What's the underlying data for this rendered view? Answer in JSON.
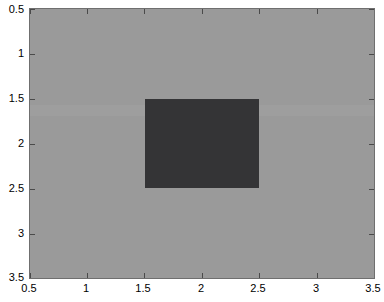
{
  "figure": {
    "background_color": "#ffffff",
    "axes_background_color": "#9a9a9a",
    "axes_border_color": "#6f6f6f",
    "tick_color": "#4a4a4a",
    "label_color": "#000000"
  },
  "chart_data": {
    "type": "heatmap",
    "title": "",
    "subtitle": "",
    "xlabel": "",
    "ylabel": "",
    "grid": false,
    "legend": "none",
    "colorbar": false,
    "xlim": [
      0.5,
      3.5
    ],
    "ylim": [
      0.5,
      3.5
    ],
    "y_axis_direction": "reversed",
    "xticks": [
      0.5,
      1,
      1.5,
      2,
      2.5,
      3,
      3.5
    ],
    "yticks": [
      0.5,
      1,
      1.5,
      2,
      2.5,
      3,
      3.5
    ],
    "xticklabels": [
      "0.5",
      "1",
      "1.5",
      "2",
      "2.5",
      "3",
      "3.5"
    ],
    "yticklabels": [
      "0.5",
      "1",
      "1.5",
      "2",
      "2.5",
      "3",
      "3.5"
    ],
    "colors": {
      "low": "#343436",
      "high": "#9a9a9a"
    },
    "cell_extent": {
      "x": [
        0.5,
        3.5
      ],
      "y": [
        0.5,
        3.5
      ]
    },
    "regions": [
      {
        "name": "background",
        "value": 1,
        "color": "#9a9a9a",
        "x_range": [
          0.5,
          3.5
        ],
        "y_range": [
          0.5,
          3.5
        ]
      },
      {
        "name": "dark-block",
        "value": 0,
        "color": "#343436",
        "x_range": [
          1.5,
          2.5
        ],
        "y_range": [
          1.5,
          2.5
        ]
      }
    ],
    "matrix_3x3": [
      [
        1,
        1,
        1
      ],
      [
        1,
        0,
        1
      ],
      [
        1,
        1,
        1
      ]
    ],
    "annotations": []
  }
}
